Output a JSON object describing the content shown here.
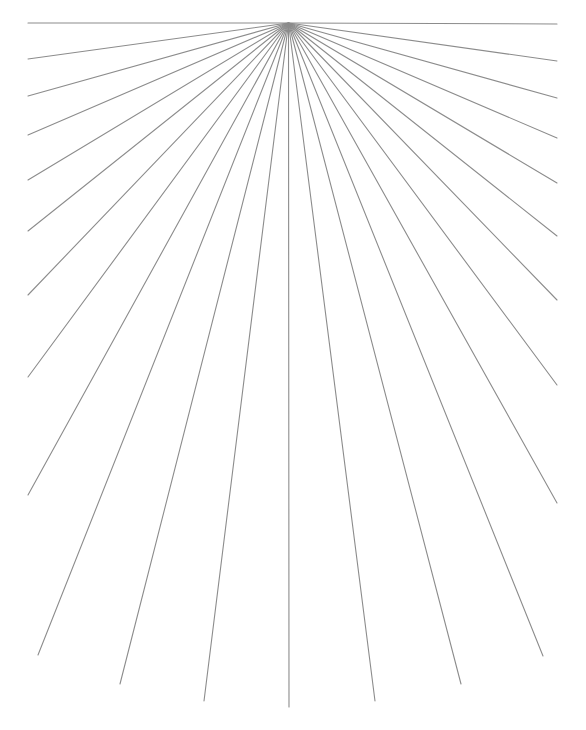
{
  "diagram": {
    "type": "radial-line-fan",
    "canvas": {
      "width": 586,
      "height": 730,
      "background": "#ffffff"
    },
    "origin": {
      "x": 288.5,
      "y": 23
    },
    "line_color": "#8c8c8c",
    "line_count": 25,
    "angle_step_deg": 7.5,
    "endpoints": [
      {
        "x": 28,
        "y": 23
      },
      {
        "x": 28,
        "y": 59
      },
      {
        "x": 28,
        "y": 96
      },
      {
        "x": 28,
        "y": 135
      },
      {
        "x": 28,
        "y": 180
      },
      {
        "x": 28,
        "y": 231
      },
      {
        "x": 28,
        "y": 295
      },
      {
        "x": 28,
        "y": 377
      },
      {
        "x": 28,
        "y": 495
      },
      {
        "x": 38,
        "y": 655
      },
      {
        "x": 120,
        "y": 684
      },
      {
        "x": 204,
        "y": 701
      },
      {
        "x": 289,
        "y": 707
      },
      {
        "x": 375,
        "y": 701
      },
      {
        "x": 461,
        "y": 684
      },
      {
        "x": 543,
        "y": 656
      },
      {
        "x": 557,
        "y": 503
      },
      {
        "x": 557,
        "y": 385
      },
      {
        "x": 557,
        "y": 300
      },
      {
        "x": 557,
        "y": 236
      },
      {
        "x": 557,
        "y": 183
      },
      {
        "x": 557,
        "y": 138
      },
      {
        "x": 557,
        "y": 98
      },
      {
        "x": 557,
        "y": 61
      },
      {
        "x": 557,
        "y": 24
      }
    ]
  }
}
